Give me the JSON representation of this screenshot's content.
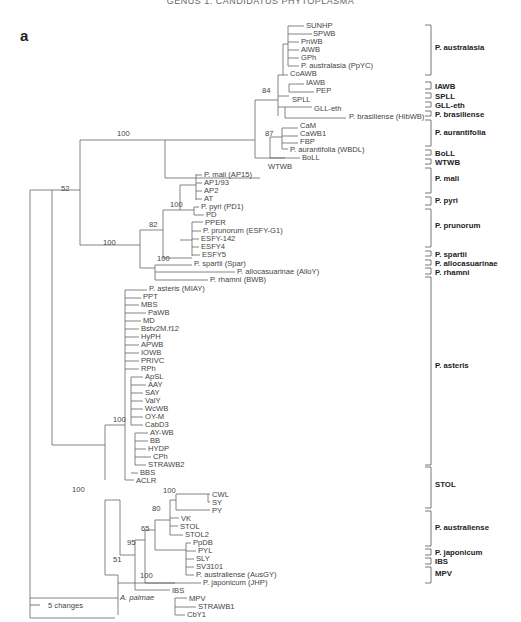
{
  "header": {
    "title": "GENUS 1. CANDIDATUS PHYTOPLASMA"
  },
  "figure": {
    "panel_label": "a",
    "scale_bar": {
      "label": "5 changes"
    },
    "outgroup": "A. palmae",
    "tips": [
      {
        "label": "SUNHP",
        "x": 306,
        "y": 25
      },
      {
        "label": "SPWB",
        "x": 313,
        "y": 33
      },
      {
        "label": "PnWB",
        "x": 301,
        "y": 41
      },
      {
        "label": "AlWB",
        "x": 301,
        "y": 49
      },
      {
        "label": "GPh",
        "x": 301,
        "y": 57
      },
      {
        "label": "P. australasia (PpYC)",
        "x": 301,
        "y": 65
      },
      {
        "label": "CoAWB",
        "x": 290,
        "y": 73
      },
      {
        "label": "IAWB",
        "x": 306,
        "y": 82
      },
      {
        "label": "PEP",
        "x": 316,
        "y": 90
      },
      {
        "label": "SPLL",
        "x": 292,
        "y": 99
      },
      {
        "label": "GLL-eth",
        "x": 314,
        "y": 108
      },
      {
        "label": "P. brasiliense (HibWB)",
        "x": 349,
        "y": 116
      },
      {
        "label": "CaM",
        "x": 300,
        "y": 125
      },
      {
        "label": "CaWB1",
        "x": 300,
        "y": 133
      },
      {
        "label": "FBP",
        "x": 300,
        "y": 141
      },
      {
        "label": "P. aurantifolia (WBDL)",
        "x": 290,
        "y": 149
      },
      {
        "label": "BoLL",
        "x": 302,
        "y": 157
      },
      {
        "label": "WTWB",
        "x": 268,
        "y": 166
      },
      {
        "label": "P. mali (AP15)",
        "x": 204,
        "y": 174
      },
      {
        "label": "AP1/93",
        "x": 204,
        "y": 182
      },
      {
        "label": "AP2",
        "x": 204,
        "y": 190
      },
      {
        "label": "AT",
        "x": 204,
        "y": 198
      },
      {
        "label": "P. pyri (PD1)",
        "x": 201,
        "y": 206
      },
      {
        "label": "PD",
        "x": 206,
        "y": 214
      },
      {
        "label": "PPER",
        "x": 205,
        "y": 222
      },
      {
        "label": "P. prunorum (ESFY-G1)",
        "x": 203,
        "y": 230
      },
      {
        "label": "ESFY-142",
        "x": 201,
        "y": 238
      },
      {
        "label": "ESFY4",
        "x": 201,
        "y": 246
      },
      {
        "label": "ESFY5",
        "x": 202,
        "y": 254
      },
      {
        "label": "P. spartii (Spar)",
        "x": 194,
        "y": 263
      },
      {
        "label": "P. allocasuarinae (AlloY)",
        "x": 237,
        "y": 271
      },
      {
        "label": "P. rhamni (BWB)",
        "x": 210,
        "y": 279
      },
      {
        "label": "P. asteris (MIAY)",
        "x": 149,
        "y": 288
      },
      {
        "label": "PPT",
        "x": 143,
        "y": 296
      },
      {
        "label": "MBS",
        "x": 141,
        "y": 304
      },
      {
        "label": "PaWB",
        "x": 148,
        "y": 312
      },
      {
        "label": "MD",
        "x": 143,
        "y": 320
      },
      {
        "label": "Bstv2M.f12",
        "x": 141,
        "y": 328
      },
      {
        "label": "HyPH",
        "x": 141,
        "y": 336
      },
      {
        "label": "APWB",
        "x": 141,
        "y": 344
      },
      {
        "label": "IOWB",
        "x": 141,
        "y": 352
      },
      {
        "label": "PRIVC",
        "x": 141,
        "y": 360
      },
      {
        "label": "RPh",
        "x": 141,
        "y": 368
      },
      {
        "label": "ApSL",
        "x": 145,
        "y": 376
      },
      {
        "label": "AAY",
        "x": 148,
        "y": 384
      },
      {
        "label": "SAY",
        "x": 145,
        "y": 392
      },
      {
        "label": "ValY",
        "x": 145,
        "y": 400
      },
      {
        "label": "WcWB",
        "x": 145,
        "y": 408
      },
      {
        "label": "OY-M",
        "x": 145,
        "y": 416
      },
      {
        "label": "CabD3",
        "x": 145,
        "y": 424
      },
      {
        "label": "AY-WB",
        "x": 150,
        "y": 432
      },
      {
        "label": "BB",
        "x": 150,
        "y": 440
      },
      {
        "label": "HYDP",
        "x": 148,
        "y": 448
      },
      {
        "label": "CPh",
        "x": 153,
        "y": 456
      },
      {
        "label": "STRAWB2",
        "x": 148,
        "y": 464
      },
      {
        "label": "BBS",
        "x": 140,
        "y": 472
      },
      {
        "label": "ACLR",
        "x": 136,
        "y": 480
      },
      {
        "label": "CWL",
        "x": 212,
        "y": 494
      },
      {
        "label": "SY",
        "x": 212,
        "y": 502
      },
      {
        "label": "PY",
        "x": 212,
        "y": 510
      },
      {
        "label": "VK",
        "x": 181,
        "y": 518
      },
      {
        "label": "STOL",
        "x": 180,
        "y": 526
      },
      {
        "label": "STOL2",
        "x": 185,
        "y": 534
      },
      {
        "label": "PpDB",
        "x": 193,
        "y": 542
      },
      {
        "label": "PYL",
        "x": 198,
        "y": 550
      },
      {
        "label": "SLY",
        "x": 196,
        "y": 558
      },
      {
        "label": "SV3101",
        "x": 196,
        "y": 566
      },
      {
        "label": "P. australiense (AusGY)",
        "x": 196,
        "y": 574
      },
      {
        "label": "P. japonicum (JHP)",
        "x": 203,
        "y": 582
      },
      {
        "label": "IBS",
        "x": 172,
        "y": 590
      },
      {
        "label": "MPV",
        "x": 189,
        "y": 598
      },
      {
        "label": "STRAWB1",
        "x": 198,
        "y": 606
      },
      {
        "label": "CbY1",
        "x": 187,
        "y": 614
      }
    ],
    "bootstrap": [
      {
        "value": "84",
        "x": 262,
        "y": 93
      },
      {
        "value": "100",
        "x": 117,
        "y": 136
      },
      {
        "value": "87",
        "x": 265,
        "y": 136
      },
      {
        "value": "52",
        "x": 61,
        "y": 191
      },
      {
        "value": "82",
        "x": 149,
        "y": 227
      },
      {
        "value": "100",
        "x": 170,
        "y": 207
      },
      {
        "value": "100",
        "x": 103,
        "y": 245
      },
      {
        "value": "100",
        "x": 157,
        "y": 261
      },
      {
        "value": "100",
        "x": 113,
        "y": 422
      },
      {
        "value": "100",
        "x": 72,
        "y": 492
      },
      {
        "value": "100",
        "x": 163,
        "y": 493
      },
      {
        "value": "80",
        "x": 152,
        "y": 511
      },
      {
        "value": "65",
        "x": 141,
        "y": 531
      },
      {
        "value": "95",
        "x": 127,
        "y": 545
      },
      {
        "value": "51",
        "x": 113,
        "y": 562
      },
      {
        "value": "100",
        "x": 140,
        "y": 578
      }
    ],
    "groups": [
      {
        "label": "P. australasia",
        "y1": 25,
        "y2": 75,
        "ty": 50
      },
      {
        "label": "IAWB",
        "y1": 82,
        "y2": 89,
        "ty": 89
      },
      {
        "label": "SPLL",
        "y1": 93,
        "y2": 98,
        "ty": 99
      },
      {
        "label": "GLL-eth",
        "y1": 102,
        "y2": 107,
        "ty": 108
      },
      {
        "label": "P. brasiliense",
        "y1": 111,
        "y2": 116,
        "ty": 117
      },
      {
        "label": "P. aurantifolia",
        "y1": 120,
        "y2": 146,
        "ty": 135
      },
      {
        "label": "BoLL",
        "y1": 150,
        "y2": 155,
        "ty": 156
      },
      {
        "label": "WTWB",
        "y1": 159,
        "y2": 164,
        "ty": 165
      },
      {
        "label": "P. mali",
        "y1": 168,
        "y2": 193,
        "ty": 181
      },
      {
        "label": "P. pyri",
        "y1": 197,
        "y2": 205,
        "ty": 203
      },
      {
        "label": "P. prunorum",
        "y1": 209,
        "y2": 247,
        "ty": 228
      },
      {
        "label": "P. spartii",
        "y1": 251,
        "y2": 256,
        "ty": 257
      },
      {
        "label": "P. allocasuarinae",
        "y1": 260,
        "y2": 265,
        "ty": 266
      },
      {
        "label": "P. rhamni",
        "y1": 268,
        "y2": 274,
        "ty": 275
      },
      {
        "label": "P. asteris",
        "y1": 277,
        "y2": 465,
        "ty": 368
      },
      {
        "label": "STOL",
        "y1": 467,
        "y2": 508,
        "ty": 487
      },
      {
        "label": "P. australiense",
        "y1": 511,
        "y2": 546,
        "ty": 530
      },
      {
        "label": "P. japonicum",
        "y1": 549,
        "y2": 555,
        "ty": 555
      },
      {
        "label": "IBS",
        "y1": 558,
        "y2": 564,
        "ty": 564
      },
      {
        "label": "MPV",
        "y1": 567,
        "y2": 583,
        "ty": 576
      }
    ]
  }
}
